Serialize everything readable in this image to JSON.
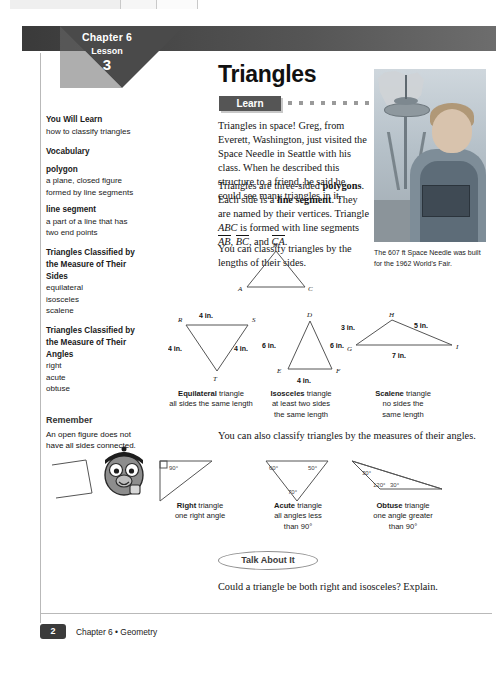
{
  "window": {
    "tabs": [
      "",
      "",
      ""
    ]
  },
  "header": {
    "chapter": "Chapter 6",
    "lesson_label": "Lesson",
    "lesson_number": "3"
  },
  "page_title": "Triangles",
  "sidebar": {
    "you_will_learn_heading": "You Will Learn",
    "you_will_learn_text": "how to classify triangles",
    "vocabulary_heading": "Vocabulary",
    "terms": [
      {
        "term": "polygon",
        "definition": "a plane, closed figure formed by line segments"
      },
      {
        "term": "line segment",
        "definition": "a part of a line that has two end points"
      }
    ],
    "classified_sides_heading": "Triangles Classified by the Measure of Their Sides",
    "sides_items": [
      "equilateral",
      "isosceles",
      "scalene"
    ],
    "classified_angles_heading": "Triangles Classified by the Measure of Their Angles",
    "angles_items": [
      "right",
      "acute",
      "obtuse"
    ]
  },
  "remember": {
    "heading": "Remember",
    "text": "An open figure does not have all sides connected."
  },
  "learn": {
    "tab_label": "Learn",
    "paragraph_1": "Triangles in space! Greg, from Everett, Washington, just visited the Space Needle in Seattle with his class. When he described this structure to a friend, he said he could see many triangles in it.",
    "paragraph_2_parts": {
      "a": "Triangles are three-sided ",
      "b": "polygons",
      "c": ". Each side is a ",
      "d": "line segment",
      "e": ". They are named by their vertices. Triangle ",
      "f": "ABC",
      "g": " is formed with line segments ",
      "h": "AB",
      "i": ", ",
      "j": "BC",
      "k": ", and ",
      "l": "CA",
      "m": "."
    },
    "paragraph_3": "You can classify triangles by the lengths of their sides."
  },
  "photo_caption": "The 607 ft Space Needle was built for the 1962 World's Fair.",
  "triangle_abc": {
    "vertices": [
      "A",
      "B",
      "C"
    ]
  },
  "figures": {
    "equilateral": {
      "vertices": [
        "R",
        "S",
        "T"
      ],
      "sides": [
        "4 in.",
        "4 in.",
        "4 in."
      ],
      "caption_bold": "Equilateral",
      "caption_rest": " triangle",
      "caption_line2": "all sides the same length"
    },
    "isosceles": {
      "vertices": [
        "D",
        "E",
        "F"
      ],
      "sides": [
        "6 in.",
        "6 in.",
        "4 in."
      ],
      "caption_bold": "Isosceles",
      "caption_rest": " triangle",
      "caption_line2": "at least two sides",
      "caption_line3": "the same length"
    },
    "scalene": {
      "vertices": [
        "G",
        "H",
        "I"
      ],
      "sides": [
        "3 in.",
        "5 in.",
        "7 in."
      ],
      "caption_bold": "Scalene",
      "caption_rest": " triangle",
      "caption_line2": "no sides the",
      "caption_line3": "same length"
    },
    "right": {
      "angles": [
        "90°"
      ],
      "caption_bold": "Right",
      "caption_rest": " triangle",
      "caption_line2": "one right angle"
    },
    "acute": {
      "angles": [
        "60°",
        "50°",
        "70°"
      ],
      "caption_bold": "Acute",
      "caption_rest": " triangle",
      "caption_line2": "all angles less",
      "caption_line3": "than 90°"
    },
    "obtuse": {
      "angles": [
        "30°",
        "120°",
        "30°"
      ],
      "caption_bold": "Obtuse",
      "caption_rest": " triangle",
      "caption_line2": "one angle greater",
      "caption_line3": "than 90°"
    }
  },
  "angles_lead_text": "You can also classify triangles by the measures of their angles.",
  "talk_about_it": {
    "label": "Talk About It",
    "question": "Could a triangle be both right and isosceles? Explain."
  },
  "footer": {
    "page_number": "2",
    "text": "Chapter 6 • Geometry"
  }
}
